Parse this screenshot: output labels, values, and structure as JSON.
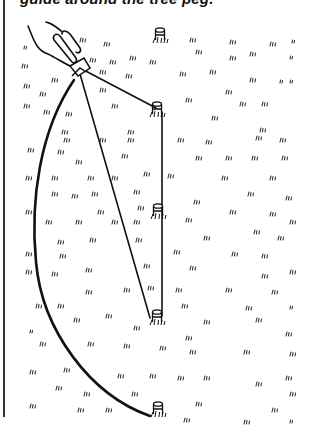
{
  "caption": {
    "text": "guide around the tree peg."
  },
  "illustration": {
    "subject": "marking a circle on grass with a string and guide stick around pegs",
    "colors": {
      "ink": "#111111",
      "background": "#ffffff",
      "frame": "#333333"
    },
    "pegs": [
      {
        "name": "top-peg",
        "x": 160,
        "y": 35
      },
      {
        "name": "peg-1",
        "x": 157,
        "y": 110
      },
      {
        "name": "peg-2",
        "x": 158,
        "y": 210
      },
      {
        "name": "peg-3",
        "x": 157,
        "y": 318
      },
      {
        "name": "peg-4",
        "x": 158,
        "y": 408
      }
    ],
    "guide": {
      "x": 78,
      "y": 68
    }
  }
}
